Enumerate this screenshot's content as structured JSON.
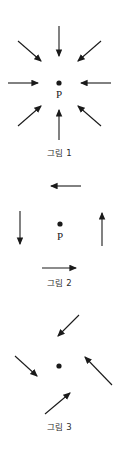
{
  "document": {
    "title": "그림 1 / 그림 2 / 그림 3",
    "background_color": "#ffffff",
    "stroke_color": "#1a1a1a",
    "text_color": "#2b2b2b",
    "width": 119,
    "height": 454
  },
  "figures": [
    {
      "id": "figure-1",
      "caption": "그림 1",
      "point_label": "P",
      "description": "eight arrows all pointing inward toward central point P",
      "center": {
        "x": 59,
        "y": 83
      },
      "point_label_position": {
        "x": 59,
        "y": 95
      },
      "caption_position": {
        "y": 146
      },
      "arrow_count": 8,
      "arrows": [
        {
          "name": "arrow-left-inward",
          "x1": 8,
          "y1": 83,
          "x2": 40,
          "y2": 83,
          "direction": "right"
        },
        {
          "name": "arrow-right-inward",
          "x1": 111,
          "y1": 83,
          "x2": 79,
          "y2": 83,
          "direction": "left"
        },
        {
          "name": "arrow-top-inward",
          "x1": 59,
          "y1": 26,
          "x2": 59,
          "y2": 58,
          "direction": "down"
        },
        {
          "name": "arrow-bottom-inward",
          "x1": 59,
          "y1": 140,
          "x2": 59,
          "y2": 108,
          "direction": "up"
        },
        {
          "name": "arrow-top-left-inward",
          "x1": 18,
          "y1": 41,
          "x2": 43,
          "y2": 63,
          "direction": "down-right"
        },
        {
          "name": "arrow-top-right-inward",
          "x1": 101,
          "y1": 41,
          "x2": 76,
          "y2": 63,
          "direction": "down-left"
        },
        {
          "name": "arrow-bottom-left-inward",
          "x1": 18,
          "y1": 126,
          "x2": 43,
          "y2": 104,
          "direction": "up-right"
        },
        {
          "name": "arrow-bottom-right-inward",
          "x1": 101,
          "y1": 126,
          "x2": 76,
          "y2": 104,
          "direction": "up-left"
        }
      ]
    },
    {
      "id": "figure-2",
      "caption": "그림 2",
      "point_label": "P",
      "description": "four arrows arranged tangentially in a rotational pattern around point P",
      "center": {
        "x": 60,
        "y": 224
      },
      "point_label_position": {
        "x": 60,
        "y": 237
      },
      "caption_position": {
        "y": 276
      },
      "arrow_count": 4,
      "arrows": [
        {
          "name": "arrow-top-leftward",
          "x1": 81,
          "y1": 186,
          "x2": 49,
          "y2": 186,
          "direction": "left"
        },
        {
          "name": "arrow-bottom-rightward",
          "x1": 42,
          "y1": 268,
          "x2": 78,
          "y2": 268,
          "direction": "right"
        },
        {
          "name": "arrow-left-downward",
          "x1": 20,
          "y1": 211,
          "x2": 20,
          "y2": 246,
          "direction": "down"
        },
        {
          "name": "arrow-right-upward",
          "x1": 102,
          "y1": 246,
          "x2": 102,
          "y2": 211,
          "direction": "up"
        }
      ]
    },
    {
      "id": "figure-3",
      "caption": "그림 3",
      "point_label": "",
      "description": "four diagonal arrows arranged in a rotational pattern around an unlabeled central point",
      "center": {
        "x": 59,
        "y": 366
      },
      "caption_position": {
        "y": 420
      },
      "arrow_count": 4,
      "arrows": [
        {
          "name": "arrow-upper-down-left",
          "x1": 79,
          "y1": 315,
          "x2": 56,
          "y2": 338,
          "direction": "down-left"
        },
        {
          "name": "arrow-left-down-right",
          "x1": 15,
          "y1": 356,
          "x2": 39,
          "y2": 378,
          "direction": "down-right"
        },
        {
          "name": "arrow-right-up-left",
          "x1": 112,
          "y1": 385,
          "x2": 83,
          "y2": 355,
          "direction": "up-left"
        },
        {
          "name": "arrow-lower-up-right",
          "x1": 45,
          "y1": 414,
          "x2": 72,
          "y2": 391,
          "direction": "up-right"
        }
      ]
    }
  ]
}
